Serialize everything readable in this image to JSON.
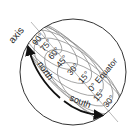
{
  "diagram": {
    "title_label": "axis",
    "direction_labels": {
      "north": "north",
      "south": "south"
    },
    "latitude_labels": [
      {
        "label": "90°"
      },
      {
        "label": "75°"
      },
      {
        "label": "60°"
      },
      {
        "label": "45°"
      },
      {
        "label": "30°"
      },
      {
        "label": "15°"
      },
      {
        "label": "0° Equator"
      },
      {
        "label": "15°"
      },
      {
        "label": "30°"
      }
    ],
    "colors": {
      "outline": "#333333",
      "latitude_lines": "#777777",
      "arrows": "#111111",
      "text": "#222222"
    }
  }
}
